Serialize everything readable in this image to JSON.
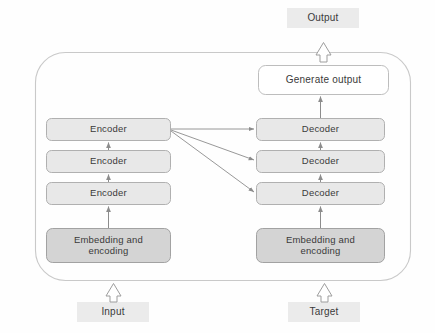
{
  "diagram": {
    "colors": {
      "outer_border": "#c9c9c9",
      "outer_fill": "#fefefe",
      "stack_fill": "#e8e8e8",
      "stack_border": "#a8a8a8",
      "embed_fill": "#d4d4d4",
      "embed_border": "#9a9a9a",
      "generate_fill": "#ffffff",
      "generate_border": "#b5b5b5",
      "io_fill": "#ebebeb",
      "arrow_stroke": "#8c8c8c",
      "hollow_arrow_fill": "#ffffff",
      "hollow_arrow_stroke": "#9d9d9d",
      "text": "#3a3a3a"
    },
    "io_nodes": [
      {
        "id": "output",
        "label": "Output"
      },
      {
        "id": "input",
        "label": "Input"
      },
      {
        "id": "target",
        "label": "Target"
      }
    ],
    "generate_node": {
      "id": "generate-output",
      "label": "Generate output"
    },
    "encoder_stack": {
      "name": "encoder-stack",
      "blocks": [
        {
          "id": "encoder-3",
          "label": "Encoder"
        },
        {
          "id": "encoder-2",
          "label": "Encoder"
        },
        {
          "id": "encoder-1",
          "label": "Encoder"
        }
      ],
      "embedding": {
        "id": "encoder-embedding",
        "label": "Embedding and\nencoding"
      }
    },
    "decoder_stack": {
      "name": "decoder-stack",
      "blocks": [
        {
          "id": "decoder-3",
          "label": "Decoder"
        },
        {
          "id": "decoder-2",
          "label": "Decoder"
        },
        {
          "id": "decoder-1",
          "label": "Decoder"
        }
      ],
      "embedding": {
        "id": "decoder-embedding",
        "label": "Embedding and\nencoding"
      }
    },
    "cross_attention": {
      "from": "encoder-3",
      "to": [
        "decoder-3",
        "decoder-2",
        "decoder-1"
      ],
      "count": 3
    }
  }
}
